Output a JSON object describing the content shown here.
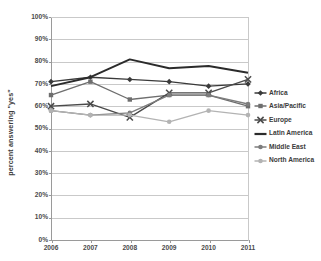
{
  "chart_data": {
    "type": "line",
    "title": "",
    "xlabel": "",
    "ylabel": "percent answering \"yes\"",
    "x": [
      "2006",
      "2007",
      "2008",
      "2009",
      "2010",
      "2011"
    ],
    "categories": [
      "2006",
      "2007",
      "2008",
      "2009",
      "2010",
      "2011"
    ],
    "ylim": [
      0,
      100
    ],
    "y_ticks": [
      "0%",
      "10%",
      "20%",
      "30%",
      "40%",
      "50%",
      "60%",
      "70%",
      "80%",
      "90%",
      "100%"
    ],
    "y_tick_values": [
      0,
      10,
      20,
      30,
      40,
      50,
      60,
      70,
      80,
      90,
      100
    ],
    "grid": true,
    "legend_position": "right",
    "series": [
      {
        "name": "Africa",
        "values": [
          71,
          73,
          72,
          71,
          69,
          70
        ],
        "color": "#3a3a3a",
        "marker": "diamond"
      },
      {
        "name": "Asia/Pacific",
        "values": [
          65,
          71,
          63,
          65,
          65,
          60
        ],
        "color": "#6e6e6e",
        "marker": "square"
      },
      {
        "name": "Europe",
        "values": [
          60,
          61,
          55,
          66,
          66,
          72
        ],
        "color": "#4a4a4a",
        "marker": "cross"
      },
      {
        "name": "Latin America",
        "values": [
          69,
          73,
          81,
          77,
          78,
          75
        ],
        "color": "#2b2b2b",
        "marker": "none"
      },
      {
        "name": "Middle East",
        "values": [
          58,
          56,
          57,
          65,
          65,
          61
        ],
        "color": "#7d7d7d",
        "marker": "dot-dark"
      },
      {
        "name": "North America",
        "values": [
          58,
          56,
          56,
          53,
          58,
          56
        ],
        "color": "#b3b3b3",
        "marker": "dot-light"
      }
    ]
  },
  "axis": {
    "y_title": "percent answering \"yes\""
  }
}
